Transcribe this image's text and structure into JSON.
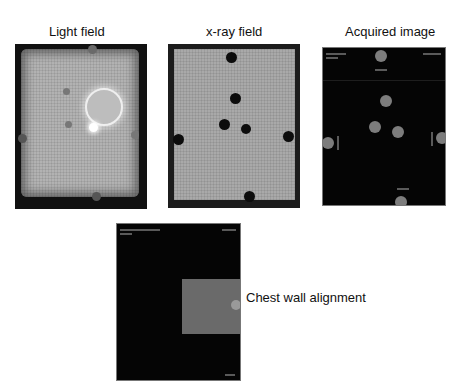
{
  "labels": {
    "light_field": "Light field",
    "xray_field": "x-ray field",
    "acquired_image": "Acquired image",
    "chest_wall": "Chest wall alignment"
  },
  "panels": {
    "light_field": {
      "description": "light field photo with grid, bright circle and markers",
      "markers": [
        {
          "x": 58,
          "y": 7
        },
        {
          "x": 57,
          "y": 48
        },
        {
          "x": 55,
          "y": 81
        },
        {
          "x": 2,
          "y": 94
        },
        {
          "x": 120,
          "y": 91
        },
        {
          "x": 80,
          "y": 154
        }
      ],
      "bright_circle": {
        "cx": 87,
        "cy": 61,
        "r": 17
      },
      "bright_dot": {
        "cx": 79,
        "cy": 84,
        "r": 4
      }
    },
    "xray_field": {
      "description": "x-ray field film with black markers",
      "markers": [
        {
          "x": 64,
          "y": 14
        },
        {
          "x": 67,
          "y": 56
        },
        {
          "x": 57,
          "y": 80
        },
        {
          "x": 78,
          "y": 85
        },
        {
          "x": 11,
          "y": 96
        },
        {
          "x": 121,
          "y": 92
        },
        {
          "x": 81,
          "y": 153
        }
      ]
    },
    "acquired_image": {
      "description": "dark digital image with grey markers",
      "markers": [
        {
          "x": 58,
          "y": 9
        },
        {
          "x": 63,
          "y": 53
        },
        {
          "x": 52,
          "y": 79
        },
        {
          "x": 75,
          "y": 84
        },
        {
          "x": 5,
          "y": 95
        },
        {
          "x": 119,
          "y": 90
        },
        {
          "x": 78,
          "y": 154
        }
      ]
    },
    "chest_wall": {
      "description": "dark image with grey rectangle at right edge",
      "rect": {
        "x": 65,
        "y": 55,
        "w": 58,
        "h": 55
      }
    }
  }
}
